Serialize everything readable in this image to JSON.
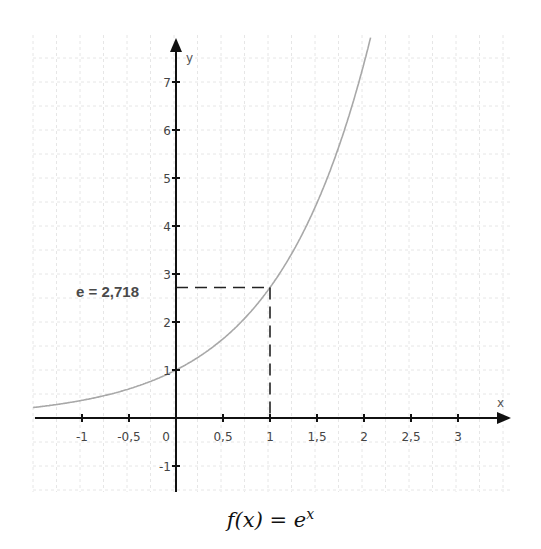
{
  "chart_data": {
    "type": "line",
    "xlabel": "x",
    "ylabel": "y",
    "xlim": [
      -1.5,
      3.5
    ],
    "ylim": [
      -1.5,
      8
    ],
    "grid": true,
    "x_ticks": [
      -1,
      -0.5,
      0,
      0.5,
      1,
      1.5,
      2,
      2.5,
      3
    ],
    "x_tick_labels": [
      "-1",
      "-0,5",
      "0",
      "0,5",
      "1",
      "1,5",
      "2",
      "2,5",
      "3"
    ],
    "y_ticks": [
      -1,
      1,
      2,
      3,
      4,
      5,
      6,
      7
    ],
    "y_tick_labels": [
      "-1",
      "1",
      "2",
      "3",
      "4",
      "5",
      "6",
      "7"
    ],
    "series": [
      {
        "name": "e^x",
        "color": "#a8a8a8",
        "x": [
          -1.5,
          -1,
          -0.5,
          0,
          0.5,
          1,
          1.5,
          2,
          2.08
        ],
        "y": [
          0.223,
          0.368,
          0.607,
          1,
          1.649,
          2.718,
          4.482,
          7.389,
          8.0
        ]
      }
    ],
    "annotations": [
      {
        "text": "e = 2,718",
        "point": [
          1,
          2.718
        ],
        "style": "dashed guide lines to both axes"
      }
    ]
  },
  "labels": {
    "x_axis": "x",
    "y_axis": "y",
    "annotation": "e = 2,718",
    "title_prefix": "f(x) = e",
    "title_exp": "x"
  },
  "colors": {
    "axis": "#111111",
    "curve": "#a8a8a8",
    "grid": "#e6e6e6",
    "dash": "#222222"
  }
}
